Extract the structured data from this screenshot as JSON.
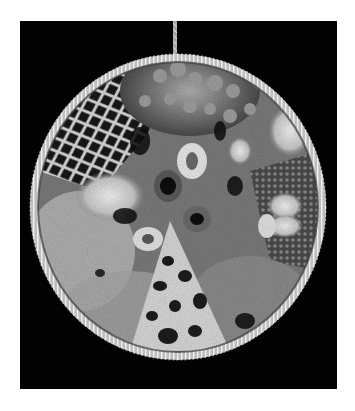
{
  "image": {
    "subject": "circular crocheted textile hoop on black background",
    "alt": "Crocheted circular wall hanging with lace mesh, bobbles and ring formations, hanging from a cord",
    "colors": {
      "page_background": "#ffffff",
      "photo_background": "#020202",
      "yarn_light": "#e8e8e8",
      "yarn_mid": "#9a9a9a",
      "yarn_dark": "#3a3a3a"
    }
  }
}
